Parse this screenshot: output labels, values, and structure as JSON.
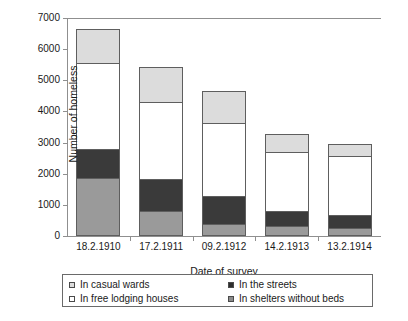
{
  "top_remnant": "",
  "chart_data": {
    "type": "bar",
    "subtype": "stacked-vertical",
    "title": "",
    "xlabel": "Date of survey",
    "ylabel": "Number of homeless",
    "ylim": [
      0,
      7000
    ],
    "ytick_step": 1000,
    "yticks": [
      "7000",
      "6000",
      "5000",
      "4000",
      "3000",
      "2000",
      "1000",
      "0"
    ],
    "ytick_values": [
      7000,
      6000,
      5000,
      4000,
      3000,
      2000,
      1000,
      0
    ],
    "grid": false,
    "legend_position": "below-plot",
    "categories": [
      "18.2.1910",
      "17.2.1911",
      "09.2.1912",
      "14.2.1913",
      "13.2.1914"
    ],
    "series": [
      {
        "name": "In shelters without beds",
        "color": "#9a9a9a",
        "stack_order": 0,
        "values": [
          1800,
          750,
          330,
          260,
          190
        ]
      },
      {
        "name": "In the streets",
        "color": "#3a3a3a",
        "stack_order": 1,
        "values": [
          950,
          1050,
          920,
          480,
          430
        ]
      },
      {
        "name": "In free lodging houses",
        "color": "#ffffff",
        "stack_order": 2,
        "values": [
          2780,
          2500,
          2350,
          1960,
          1930
        ]
      },
      {
        "name": "In casual wards",
        "color": "#dcdcdc",
        "stack_order": 3,
        "values": [
          1120,
          1140,
          1050,
          580,
          390
        ]
      }
    ],
    "totals": [
      6650,
      5440,
      4650,
      3280,
      2940
    ]
  },
  "legend": {
    "columns": [
      {
        "items": [
          {
            "label": "In casual wards",
            "swatch_color": "#dcdcdc",
            "swatch_name": "legend-swatch-casual-wards"
          },
          {
            "label": "In free lodging houses",
            "swatch_color": "#ffffff",
            "swatch_name": "legend-swatch-free-lodging-houses"
          }
        ]
      },
      {
        "items": [
          {
            "label": "In the streets",
            "swatch_color": "#2d2d2d",
            "swatch_name": "legend-swatch-in-the-streets"
          },
          {
            "label": "In shelters without beds",
            "swatch_color": "#8c8c8c",
            "swatch_name": "legend-swatch-shelters-without-beds"
          }
        ]
      }
    ]
  },
  "colors": {
    "axis": "#8f8f8f",
    "bar_outline": "#5e5e5e",
    "text": "#1a1a1a",
    "background": "#ffffff"
  }
}
